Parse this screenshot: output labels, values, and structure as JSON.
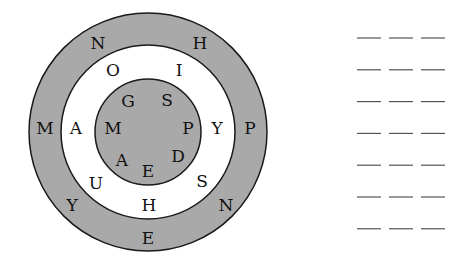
{
  "colors": {
    "ring": "#a9a9a9",
    "stroke": "#1a1a1a",
    "white": "#ffffff",
    "blank": "#555555"
  },
  "outer_ring": [
    {
      "t": "N",
      "x": 98,
      "y": 43
    },
    {
      "t": "H",
      "x": 200,
      "y": 43
    },
    {
      "t": "M",
      "x": 45,
      "y": 128
    },
    {
      "t": "P",
      "x": 250,
      "y": 128
    },
    {
      "t": "Y",
      "x": 72,
      "y": 205
    },
    {
      "t": "N",
      "x": 226,
      "y": 205
    },
    {
      "t": "E",
      "x": 148,
      "y": 238
    }
  ],
  "middle_ring": [
    {
      "t": "O",
      "x": 113,
      "y": 70
    },
    {
      "t": "I",
      "x": 179,
      "y": 70
    },
    {
      "t": "A",
      "x": 76,
      "y": 128
    },
    {
      "t": "Y",
      "x": 217,
      "y": 128
    },
    {
      "t": "U",
      "x": 96,
      "y": 183
    },
    {
      "t": "S",
      "x": 202,
      "y": 181
    },
    {
      "t": "H",
      "x": 149,
      "y": 205
    }
  ],
  "inner_circle": [
    {
      "t": "G",
      "x": 128,
      "y": 101
    },
    {
      "t": "S",
      "x": 167,
      "y": 100
    },
    {
      "t": "M",
      "x": 113,
      "y": 128
    },
    {
      "t": "P",
      "x": 188,
      "y": 128
    },
    {
      "t": "A",
      "x": 122,
      "y": 160
    },
    {
      "t": "E",
      "x": 148,
      "y": 171
    },
    {
      "t": "D",
      "x": 178,
      "y": 156
    }
  ],
  "blanks": {
    "rows": 7,
    "per_row": 3
  }
}
